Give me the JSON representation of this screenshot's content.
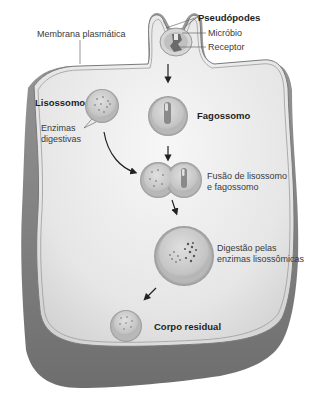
{
  "figure": {
    "labels": {
      "plasma_membrane": "Membrana plasmática",
      "pseudopods": "Pseudópodes",
      "microbe": "Micróbio",
      "receptor": "Receptor",
      "lysosome": "Lisossomo",
      "digestive_enzymes_line1": "Enzimas",
      "digestive_enzymes_line2": "digestivas",
      "phagosome": "Fagossomo",
      "fusion_line1": "Fusão de lisossomo",
      "fusion_line2": "e fagossomo",
      "digestion_line1": "Digestão pelas",
      "digestion_line2": "enzimas lisossômicas",
      "residual_body": "Corpo residual"
    },
    "stages": [
      "Pseudópodes",
      "Fagossomo",
      "Fusão de lisossomo e fagossomo",
      "Digestão pelas enzimas lisossômicas",
      "Corpo residual"
    ],
    "colors": {
      "cell_fill": "#e9e9e9",
      "cell_edge": "#7a7a7a",
      "cell_side": "#8c8c8c",
      "vesicle_fill": "#cfcfcf",
      "vesicle_rim": "#9a9a9a",
      "text": "#3a3a3a",
      "arrow": "#222222"
    }
  }
}
